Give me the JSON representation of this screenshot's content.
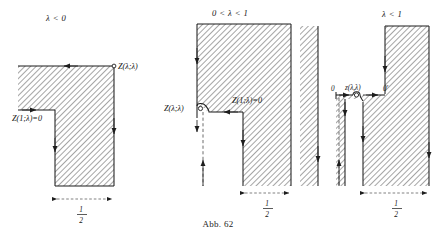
{
  "figure": {
    "caption": "Abb. 62",
    "panels": [
      {
        "id": "panel-lambda-negative",
        "condition": "λ < 0",
        "labels": {
          "corner_point": "Z(λ;λ)",
          "inner_edge": "Z(1;λ)=0"
        },
        "dimension": {
          "numerator": "1",
          "denominator": "2"
        }
      },
      {
        "id": "panel-lambda-between-zero-and-one",
        "condition": "0 < λ < 1",
        "labels": {
          "corner_point": "Z(λ;λ)",
          "inner_edge": "Z(1;λ)=0"
        },
        "dimension": {
          "numerator": "1",
          "denominator": "2"
        }
      },
      {
        "id": "panel-lambda-less-than-one",
        "condition": "λ < 1",
        "labels": {
          "origin": "0",
          "corner_point": "z(λ,λ)",
          "origin_prime": "0'"
        },
        "dimension": {
          "numerator": "1",
          "denominator": "2"
        }
      }
    ]
  },
  "colors": {
    "ink": "#1d1d1d",
    "hatch": "#6f6f6f",
    "hatch_background": "#ffffff",
    "dashed_axis": "#5c5c5c",
    "page_background": "#ffffff"
  }
}
